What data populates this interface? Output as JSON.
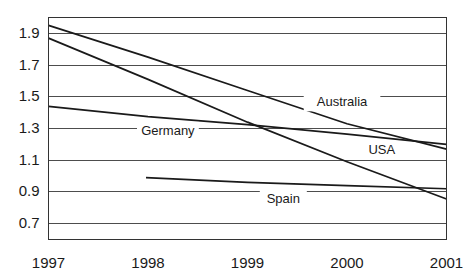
{
  "chart_data": {
    "type": "line",
    "title": "",
    "subtitle": "",
    "xlabel": "",
    "ylabel": "",
    "x": [
      1997,
      1998,
      1999,
      2000,
      2001
    ],
    "xtick_labels": [
      "1997",
      "1998",
      "1999",
      "2000",
      "2001"
    ],
    "ytick_labels": [
      "1.9",
      "1.7",
      "1.5",
      "1.3",
      "1.1",
      "0.9",
      "0.7"
    ],
    "ytick_values": [
      1.9,
      1.7,
      1.5,
      1.3,
      1.1,
      0.9,
      0.7
    ],
    "xlim": [
      1997,
      2001
    ],
    "ylim": [
      0.6,
      2.0
    ],
    "grid": "horizontal",
    "legend_position": "inline-labels",
    "series": [
      {
        "name": "Australia",
        "label": "Australia",
        "x": [
          1997,
          1998,
          1999,
          2000,
          2001
        ],
        "values": [
          1.95,
          1.75,
          1.54,
          1.33,
          1.17
        ],
        "label_x": 1999.95,
        "label_y": 1.465
      },
      {
        "name": "USA",
        "label": "USA",
        "x": [
          1997,
          1998,
          1999,
          2000,
          2001
        ],
        "values": [
          1.87,
          1.61,
          1.34,
          1.09,
          0.855
        ],
        "label_x": 2000.35,
        "label_y": 1.165
      },
      {
        "name": "Germany",
        "label": "Germany",
        "x": [
          1997,
          1998,
          1999,
          2000,
          2001
        ],
        "values": [
          1.44,
          1.375,
          1.325,
          1.265,
          1.2
        ],
        "label_x": 1998.2,
        "label_y": 1.285
      },
      {
        "name": "Spain",
        "label": "Spain",
        "x": [
          1997.98,
          1999,
          2000,
          2001
        ],
        "values": [
          0.99,
          0.96,
          0.94,
          0.92
        ],
        "label_x": 1999.36,
        "label_y": 0.855
      }
    ],
    "colors": {
      "line": "#1a1a1a",
      "grid": "#4d4d4d",
      "frame": "#333333",
      "text": "#1a1a1a",
      "background": "#ffffff"
    }
  }
}
